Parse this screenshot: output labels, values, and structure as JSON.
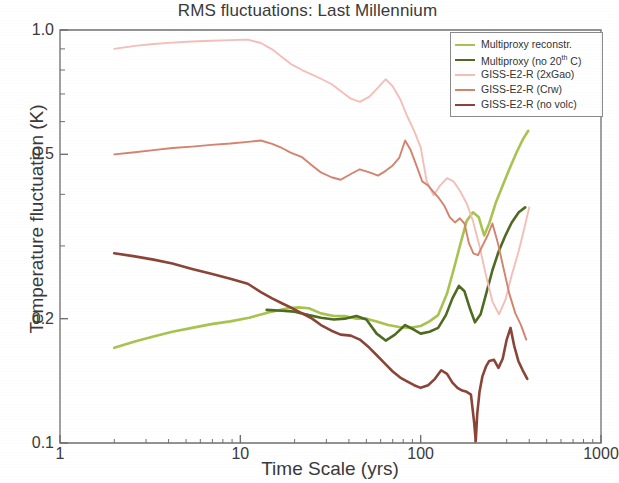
{
  "chart_data": {
    "type": "line",
    "title": "RMS fluctuations: Last Millennium",
    "xlabel": "Time Scale (yrs)",
    "ylabel": "Temperature fluctuation (K)",
    "xscale": "log",
    "yscale": "log",
    "xlim": [
      1,
      1000
    ],
    "ylim": [
      0.1,
      1.0
    ],
    "xticks": [
      "1",
      "10",
      "100",
      "1000"
    ],
    "xtick_values": [
      1,
      10,
      100,
      1000
    ],
    "yticks": [
      "1.0",
      "0.5",
      "0.2",
      "0.1"
    ],
    "ytick_values": [
      1.0,
      0.5,
      0.2,
      0.1
    ],
    "grid": false,
    "legend_position": "top-right",
    "series": [
      {
        "name": "Multiproxy reconstr.",
        "color": "#a8c350",
        "points": [
          [
            2.0,
            0.17
          ],
          [
            2.6,
            0.176
          ],
          [
            3.3,
            0.181
          ],
          [
            4.2,
            0.186
          ],
          [
            5.4,
            0.19
          ],
          [
            6.9,
            0.194
          ],
          [
            8.8,
            0.197
          ],
          [
            11.2,
            0.201
          ],
          [
            14.3,
            0.207
          ],
          [
            18.3,
            0.212
          ],
          [
            21.0,
            0.213
          ],
          [
            24.0,
            0.212
          ],
          [
            28.0,
            0.206
          ],
          [
            33.0,
            0.203
          ],
          [
            38.0,
            0.203
          ],
          [
            44.0,
            0.2
          ],
          [
            50.0,
            0.2
          ],
          [
            57.0,
            0.197
          ],
          [
            66.0,
            0.193
          ],
          [
            76.0,
            0.191
          ],
          [
            87.0,
            0.19
          ],
          [
            100.0,
            0.192
          ],
          [
            112.0,
            0.197
          ],
          [
            125.0,
            0.204
          ],
          [
            140.0,
            0.23
          ],
          [
            152.0,
            0.262
          ],
          [
            165.0,
            0.3
          ],
          [
            180.0,
            0.345
          ],
          [
            195.0,
            0.362
          ],
          [
            210.0,
            0.352
          ],
          [
            225.0,
            0.318
          ],
          [
            240.0,
            0.34
          ],
          [
            260.0,
            0.38
          ],
          [
            285.0,
            0.42
          ],
          [
            310.0,
            0.46
          ],
          [
            340.0,
            0.505
          ],
          [
            370.0,
            0.545
          ],
          [
            395.0,
            0.57
          ]
        ]
      },
      {
        "name": "Multiproxy (no 20th C)",
        "color": "#4f6b22",
        "points": [
          [
            14.0,
            0.21
          ],
          [
            17.0,
            0.209
          ],
          [
            20.0,
            0.208
          ],
          [
            24.0,
            0.204
          ],
          [
            28.0,
            0.201
          ],
          [
            33.0,
            0.199
          ],
          [
            38.0,
            0.2
          ],
          [
            44.0,
            0.203
          ],
          [
            50.0,
            0.199
          ],
          [
            57.0,
            0.184
          ],
          [
            64.0,
            0.177
          ],
          [
            72.0,
            0.183
          ],
          [
            82.0,
            0.193
          ],
          [
            92.0,
            0.188
          ],
          [
            100.0,
            0.184
          ],
          [
            112.0,
            0.186
          ],
          [
            125.0,
            0.19
          ],
          [
            138.0,
            0.204
          ],
          [
            150.0,
            0.224
          ],
          [
            163.0,
            0.24
          ],
          [
            175.0,
            0.233
          ],
          [
            188.0,
            0.211
          ],
          [
            200.0,
            0.196
          ],
          [
            215.0,
            0.205
          ],
          [
            232.0,
            0.232
          ],
          [
            250.0,
            0.262
          ],
          [
            270.0,
            0.29
          ],
          [
            295.0,
            0.318
          ],
          [
            320.0,
            0.342
          ],
          [
            350.0,
            0.362
          ],
          [
            380.0,
            0.372
          ]
        ]
      },
      {
        "name": "GISS-E2-R (2xGao)",
        "color": "#f3bfb8",
        "points": [
          [
            2.0,
            0.9
          ],
          [
            2.6,
            0.915
          ],
          [
            3.3,
            0.925
          ],
          [
            4.2,
            0.932
          ],
          [
            5.4,
            0.938
          ],
          [
            6.9,
            0.942
          ],
          [
            8.8,
            0.945
          ],
          [
            11.0,
            0.948
          ],
          [
            13.0,
            0.93
          ],
          [
            15.0,
            0.898
          ],
          [
            17.0,
            0.86
          ],
          [
            19.0,
            0.828
          ],
          [
            22.0,
            0.8
          ],
          [
            25.0,
            0.78
          ],
          [
            28.0,
            0.762
          ],
          [
            32.0,
            0.74
          ],
          [
            36.0,
            0.712
          ],
          [
            41.0,
            0.682
          ],
          [
            46.0,
            0.67
          ],
          [
            52.0,
            0.69
          ],
          [
            58.0,
            0.725
          ],
          [
            64.0,
            0.76
          ],
          [
            70.0,
            0.73
          ],
          [
            77.0,
            0.68
          ],
          [
            84.0,
            0.62
          ],
          [
            92.0,
            0.57
          ],
          [
            100.0,
            0.52
          ],
          [
            108.0,
            0.43
          ],
          [
            118.0,
            0.398
          ],
          [
            128.0,
            0.42
          ],
          [
            140.0,
            0.438
          ],
          [
            152.0,
            0.43
          ],
          [
            165.0,
            0.408
          ],
          [
            180.0,
            0.38
          ],
          [
            195.0,
            0.345
          ],
          [
            212.0,
            0.3
          ],
          [
            230.0,
            0.255
          ],
          [
            250.0,
            0.22
          ],
          [
            272.0,
            0.205
          ],
          [
            295.0,
            0.222
          ],
          [
            320.0,
            0.255
          ],
          [
            350.0,
            0.292
          ],
          [
            375.0,
            0.33
          ],
          [
            400.0,
            0.372
          ]
        ]
      },
      {
        "name": "GISS-E2-R (Crw)",
        "color": "#d4836e",
        "points": [
          [
            2.0,
            0.5
          ],
          [
            2.6,
            0.506
          ],
          [
            3.3,
            0.512
          ],
          [
            4.2,
            0.518
          ],
          [
            5.4,
            0.522
          ],
          [
            6.9,
            0.527
          ],
          [
            8.8,
            0.531
          ],
          [
            11.0,
            0.536
          ],
          [
            13.0,
            0.54
          ],
          [
            15.0,
            0.53
          ],
          [
            17.0,
            0.518
          ],
          [
            19.0,
            0.505
          ],
          [
            22.0,
            0.492
          ],
          [
            25.0,
            0.47
          ],
          [
            28.0,
            0.452
          ],
          [
            32.0,
            0.44
          ],
          [
            36.0,
            0.434
          ],
          [
            41.0,
            0.448
          ],
          [
            46.0,
            0.46
          ],
          [
            52.0,
            0.452
          ],
          [
            58.0,
            0.444
          ],
          [
            64.0,
            0.456
          ],
          [
            70.0,
            0.47
          ],
          [
            76.0,
            0.49
          ],
          [
            82.0,
            0.54
          ],
          [
            88.0,
            0.512
          ],
          [
            95.0,
            0.468
          ],
          [
            102.0,
            0.43
          ],
          [
            110.0,
            0.42
          ],
          [
            118.0,
            0.405
          ],
          [
            126.0,
            0.392
          ],
          [
            135.0,
            0.376
          ],
          [
            145.0,
            0.352
          ],
          [
            155.0,
            0.342
          ],
          [
            165.0,
            0.35
          ],
          [
            175.0,
            0.34
          ],
          [
            185.0,
            0.305
          ],
          [
            196.0,
            0.288
          ],
          [
            208.0,
            0.285
          ],
          [
            220.0,
            0.3
          ],
          [
            235.0,
            0.318
          ],
          [
            250.0,
            0.34
          ],
          [
            268.0,
            0.305
          ],
          [
            288.0,
            0.265
          ],
          [
            310.0,
            0.23
          ],
          [
            335.0,
            0.206
          ],
          [
            360.0,
            0.193
          ],
          [
            385.0,
            0.178
          ]
        ]
      },
      {
        "name": "GISS-E2-R (no volc)",
        "color": "#8a4438",
        "points": [
          [
            2.0,
            0.288
          ],
          [
            2.6,
            0.283
          ],
          [
            3.3,
            0.278
          ],
          [
            4.2,
            0.272
          ],
          [
            5.4,
            0.264
          ],
          [
            6.9,
            0.257
          ],
          [
            8.8,
            0.25
          ],
          [
            11.0,
            0.243
          ],
          [
            13.0,
            0.232
          ],
          [
            15.0,
            0.224
          ],
          [
            17.0,
            0.218
          ],
          [
            19.0,
            0.213
          ],
          [
            22.0,
            0.206
          ],
          [
            25.0,
            0.2
          ],
          [
            28.0,
            0.193
          ],
          [
            32.0,
            0.187
          ],
          [
            36.0,
            0.183
          ],
          [
            41.0,
            0.182
          ],
          [
            46.0,
            0.178
          ],
          [
            52.0,
            0.17
          ],
          [
            58.0,
            0.162
          ],
          [
            64.0,
            0.155
          ],
          [
            70.0,
            0.149
          ],
          [
            77.0,
            0.144
          ],
          [
            84.0,
            0.141
          ],
          [
            92.0,
            0.138
          ],
          [
            100.0,
            0.136
          ],
          [
            110.0,
            0.138
          ],
          [
            120.0,
            0.143
          ],
          [
            130.0,
            0.15
          ],
          [
            140.0,
            0.147
          ],
          [
            150.0,
            0.14
          ],
          [
            160.0,
            0.136
          ],
          [
            170.0,
            0.134
          ],
          [
            180.0,
            0.133
          ],
          [
            190.0,
            0.131
          ],
          [
            198.0,
            0.112
          ],
          [
            202.0,
            0.101
          ],
          [
            206.0,
            0.118
          ],
          [
            212.0,
            0.133
          ],
          [
            220.0,
            0.145
          ],
          [
            230.0,
            0.153
          ],
          [
            240.0,
            0.158
          ],
          [
            255.0,
            0.159
          ],
          [
            270.0,
            0.152
          ],
          [
            285.0,
            0.16
          ],
          [
            300.0,
            0.178
          ],
          [
            315.0,
            0.19
          ],
          [
            330.0,
            0.172
          ],
          [
            348.0,
            0.158
          ],
          [
            368.0,
            0.15
          ],
          [
            390.0,
            0.143
          ]
        ]
      }
    ]
  },
  "legend": {
    "items": [
      {
        "label": "Multiproxy reconstr.",
        "color": "#a8c350"
      },
      {
        "label_pre": "Multiproxy (no 20",
        "label_sup": "th",
        "label_post": " C)",
        "color": "#4f6b22"
      },
      {
        "label": "GISS-E2-R (2xGao)",
        "color": "#f3bfb8"
      },
      {
        "label": "GISS-E2-R (Crw)",
        "color": "#d4836e"
      },
      {
        "label": "GISS-E2-R (no volc)",
        "color": "#8a4438"
      }
    ]
  },
  "axes": {
    "frame_color": "#6f6f6f",
    "text_color": "#3a3a3a"
  }
}
